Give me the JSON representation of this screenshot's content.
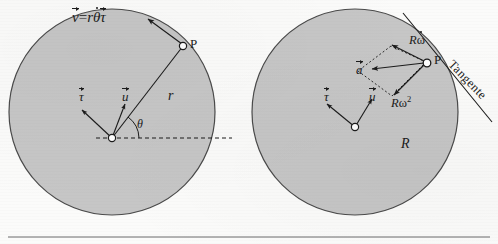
{
  "figure": {
    "background_color": "#fbfbfa",
    "circle_fill": "#c6c6c6",
    "circle_stroke": "#4a4a4a",
    "ink_color": "#1b1b1b",
    "baseline_rule_color": "#6d6d6d"
  },
  "left_diagram": {
    "name": "velocity-diagram",
    "circle": {
      "cx": 112,
      "cy": 112,
      "r": 103
    },
    "center_label": "",
    "point_label": "P",
    "radius_label": "r",
    "angle_label": "θ",
    "velocity_formula": {
      "v_symbol": "v",
      "equals": "=",
      "r_symbol": "r",
      "theta_symbol": "θ",
      "tau_symbol": "τ"
    },
    "unit_vectors": [
      {
        "symbol": "τ",
        "name": "tau-unit-vector"
      },
      {
        "symbol": "u",
        "name": "u-unit-vector"
      }
    ]
  },
  "right_diagram": {
    "name": "acceleration-diagram",
    "circle": {
      "cx": 355,
      "cy": 112,
      "r": 103
    },
    "point_label": "P",
    "radius_label": "R",
    "acceleration_label": "a",
    "tangential_component": {
      "prefix": "R",
      "symbol": "ω",
      "accent": "dot"
    },
    "normal_component": {
      "prefix": "R",
      "symbol": "ω",
      "exponent": "2"
    },
    "tangent_line_label": "Tangente",
    "unit_vectors": [
      {
        "symbol": "τ",
        "name": "tau-unit-vector"
      },
      {
        "symbol": "u",
        "name": "u-unit-vector"
      }
    ]
  }
}
